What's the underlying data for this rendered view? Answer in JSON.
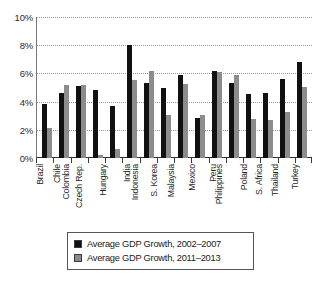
{
  "chart_data": {
    "type": "bar",
    "title": "",
    "xlabel": "",
    "ylabel": "",
    "ylim": [
      0,
      10
    ],
    "ytick_values": [
      0,
      2,
      4,
      6,
      8,
      10
    ],
    "ytick_labels": [
      "0%",
      "2%",
      "4%",
      "6%",
      "8%",
      "10%"
    ],
    "grid": true,
    "legend_position": "bottom",
    "categories": [
      "Brazil",
      "Chile",
      "Colombia",
      "Czech Rep.",
      "Hungary",
      "India",
      "Indonesia",
      "S. Korea",
      "Malaysia",
      "Mexico",
      "Peru",
      "Philippines",
      "Poland",
      "S. Africa",
      "Thailand",
      "Turkey"
    ],
    "series": [
      {
        "name": "Average GDP Growth, 2002–2007",
        "color": "#111111",
        "values": [
          3.85,
          4.6,
          5.1,
          4.85,
          3.7,
          8.05,
          5.35,
          5.0,
          5.9,
          2.85,
          6.15,
          5.35,
          4.55,
          4.6,
          5.6,
          6.8
        ]
      },
      {
        "name": "Average GDP Growth, 2011–2013",
        "color": "#8c8c8c",
        "values": [
          2.15,
          5.2,
          5.2,
          0.2,
          0.65,
          5.5,
          6.2,
          3.05,
          5.25,
          3.05,
          6.1,
          5.9,
          2.75,
          2.7,
          3.25,
          5.05
        ]
      }
    ]
  },
  "legend": {
    "items": [
      {
        "label": "Average GDP Growth, 2002–2007",
        "color": "#111111"
      },
      {
        "label": "Average GDP Growth, 2011–2013",
        "color": "#8c8c8c"
      }
    ]
  }
}
